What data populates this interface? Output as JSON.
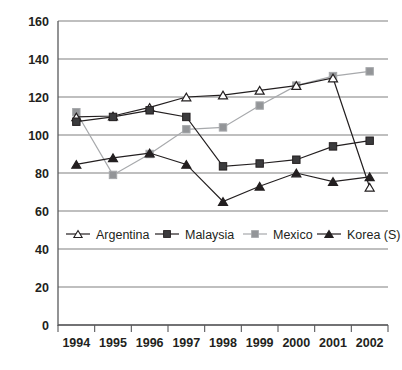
{
  "chart_data": {
    "type": "line",
    "title": "",
    "subtitle": "",
    "xlabel": "",
    "ylabel": "",
    "x": [
      "1994",
      "1995",
      "1996",
      "1997",
      "1998",
      "1999",
      "2000",
      "2001",
      "2002"
    ],
    "categories": [
      "1994",
      "1995",
      "1996",
      "1997",
      "1998",
      "1999",
      "2000",
      "2001",
      "2002"
    ],
    "ylim": [
      0,
      160
    ],
    "ytick_values": [
      0,
      20,
      40,
      60,
      80,
      100,
      120,
      140,
      160
    ],
    "ytick_labels": [
      "0",
      "20",
      "40",
      "60",
      "80",
      "100",
      "120",
      "140",
      "160"
    ],
    "grid": true,
    "legend_position": "inside-lower-left",
    "series": [
      {
        "name": "Argentina",
        "marker": "open-triangle",
        "color": "#231f20",
        "marker_fill": "#ffffff",
        "values": [
          109.5,
          110,
          114.5,
          120,
          121,
          123.5,
          126,
          130,
          72.5
        ]
      },
      {
        "name": "Malaysia",
        "marker": "filled-square",
        "color": "#231f20",
        "marker_fill": "#3b3b3d",
        "values": [
          107,
          109.5,
          113,
          109.5,
          83.5,
          85,
          87,
          94,
          97
        ]
      },
      {
        "name": "Mexico",
        "marker": "filled-square",
        "color": "#a7a9ac",
        "marker_fill": "#939598",
        "values": [
          112,
          79,
          90,
          103,
          104,
          115.5,
          126,
          131,
          133.5
        ]
      },
      {
        "name": "Korea (S)",
        "marker": "filled-triangle",
        "color": "#231f20",
        "marker_fill": "#231f20",
        "values": [
          84.5,
          88,
          90.5,
          84.5,
          65,
          73,
          80,
          75.5,
          78
        ]
      }
    ]
  },
  "legend": {
    "items": [
      {
        "label": "Argentina"
      },
      {
        "label": "Malaysia"
      },
      {
        "label": "Mexico"
      },
      {
        "label": "Korea (S)"
      }
    ]
  }
}
